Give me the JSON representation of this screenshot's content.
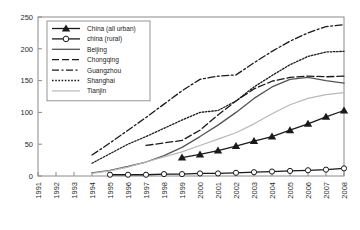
{
  "chart_data": {
    "type": "line",
    "title": "",
    "xlabel": "",
    "ylabel": "",
    "xlim": [
      1991,
      2008
    ],
    "ylim": [
      0,
      250
    ],
    "ytick_values": [
      0,
      50,
      100,
      150,
      200,
      250
    ],
    "ytick_labels": [
      "0",
      "50",
      "100",
      "150",
      "200",
      "250"
    ],
    "x": [
      1991,
      1992,
      1993,
      1994,
      1995,
      1996,
      1997,
      1998,
      1999,
      2000,
      2001,
      2002,
      2003,
      2004,
      2005,
      2006,
      2007,
      2008
    ],
    "xtick_labels": [
      "1991",
      "1992",
      "1993",
      "1994",
      "1995",
      "1996",
      "1997",
      "1998",
      "1999",
      "2000",
      "2001",
      "2002",
      "2003",
      "2004",
      "2005",
      "2006",
      "2007",
      "2008"
    ],
    "grid": false,
    "legend_position": "upper-left",
    "series": [
      {
        "name": "China (all urban)",
        "style": "solid-triangle",
        "color": "#1a1a1a",
        "marker": "triangle",
        "x": [
          1999,
          2000,
          2001,
          2002,
          2003,
          2004,
          2005,
          2006,
          2007,
          2008
        ],
        "values": [
          29,
          34,
          40,
          47,
          55,
          62,
          72,
          82,
          93,
          103
        ]
      },
      {
        "name": "china (rural)",
        "style": "solid-circle",
        "color": "#1a1a1a",
        "marker": "circle",
        "x": [
          1995,
          1996,
          1997,
          1998,
          1999,
          2000,
          2001,
          2002,
          2003,
          2004,
          2005,
          2006,
          2007,
          2008
        ],
        "values": [
          2,
          2,
          2,
          3,
          3,
          4,
          4,
          5,
          6,
          7,
          8,
          9,
          10,
          12
        ]
      },
      {
        "name": "Beijing",
        "style": "solid",
        "color": "#555555",
        "marker": "none",
        "x": [
          1994,
          1995,
          1996,
          1997,
          1998,
          1999,
          2000,
          2001,
          2002,
          2003,
          2004,
          2005,
          2006,
          2007,
          2008
        ],
        "values": [
          5,
          9,
          15,
          22,
          32,
          45,
          62,
          80,
          100,
          122,
          140,
          152,
          155,
          150,
          146
        ]
      },
      {
        "name": "Chongqing",
        "style": "dashed",
        "color": "#1a1a1a",
        "marker": "none",
        "x": [
          1997,
          1998,
          1999,
          2000,
          2001,
          2002,
          2003,
          2004,
          2005,
          2006,
          2007,
          2008
        ],
        "values": [
          48,
          52,
          56,
          72,
          96,
          118,
          137,
          149,
          155,
          157,
          156,
          157
        ]
      },
      {
        "name": "Guangzhou",
        "style": "dashdot",
        "color": "#1a1a1a",
        "marker": "none",
        "x": [
          1994,
          1995,
          1996,
          1997,
          1998,
          1999,
          2000,
          2001,
          2002,
          2003,
          2004,
          2005,
          2006,
          2007,
          2008
        ],
        "values": [
          33,
          52,
          72,
          92,
          113,
          134,
          152,
          157,
          159,
          178,
          196,
          212,
          225,
          235,
          238
        ]
      },
      {
        "name": "Shanghai",
        "style": "dotted",
        "color": "#1a1a1a",
        "marker": "none",
        "x": [
          1994,
          1995,
          1996,
          1997,
          1998,
          1999,
          2000,
          2001,
          2002,
          2003,
          2004,
          2005,
          2006,
          2007,
          2008
        ],
        "values": [
          20,
          35,
          50,
          62,
          75,
          88,
          100,
          103,
          118,
          140,
          158,
          175,
          188,
          195,
          196
        ]
      },
      {
        "name": "Tianjin",
        "style": "solid-light",
        "color": "#b8b8b8",
        "marker": "none",
        "x": [
          1994,
          1995,
          1996,
          1997,
          1998,
          1999,
          2000,
          2001,
          2002,
          2003,
          2004,
          2005,
          2006,
          2007,
          2008
        ],
        "values": [
          4,
          8,
          14,
          22,
          30,
          38,
          48,
          58,
          68,
          82,
          98,
          112,
          122,
          128,
          131
        ]
      }
    ]
  },
  "legend": {
    "items": [
      {
        "label": "China (all urban)"
      },
      {
        "label": "china (rural)"
      },
      {
        "label": "Beijing"
      },
      {
        "label": "Chongqing"
      },
      {
        "label": "Guangzhou"
      },
      {
        "label": "Shanghai"
      },
      {
        "label": "Tianjin"
      }
    ]
  },
  "colors": {
    "axis": "#8a8a8a",
    "text": "#2b2b2b",
    "dark_series": "#1a1a1a",
    "beijing": "#555555",
    "tianjin": "#b8b8b8",
    "legend_border": "#8a8a8a"
  }
}
